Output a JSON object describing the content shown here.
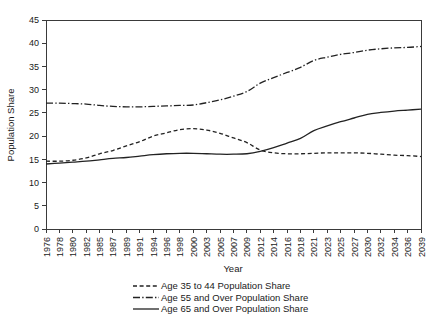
{
  "chart_data": {
    "type": "line",
    "title": "",
    "xlabel": "Year",
    "ylabel": "Population Share",
    "ylim": [
      0,
      45
    ],
    "ytick_step": 5,
    "yticks": [
      0,
      5,
      10,
      15,
      20,
      25,
      30,
      35,
      40,
      45
    ],
    "grid": false,
    "legend_position": "bottom",
    "categories": [
      "1976",
      "1978",
      "1980",
      "1982",
      "1985",
      "1987",
      "1989",
      "1991",
      "1994",
      "1996",
      "1998",
      "2000",
      "2003",
      "2005",
      "2007",
      "2009",
      "2012",
      "2014",
      "2016",
      "2018",
      "2021",
      "2023",
      "2025",
      "2027",
      "2030",
      "2032",
      "2034",
      "2036",
      "2039"
    ],
    "series": [
      {
        "name": "Age 35 to 44 Population Share",
        "style": "dashed",
        "values": [
          14.6,
          14.6,
          14.8,
          15.3,
          16.2,
          16.9,
          17.9,
          18.8,
          20.0,
          20.7,
          21.4,
          21.6,
          21.3,
          20.6,
          19.6,
          18.6,
          17.0,
          16.4,
          16.2,
          16.2,
          16.3,
          16.4,
          16.4,
          16.4,
          16.3,
          16.1,
          15.9,
          15.8,
          15.6
        ]
      },
      {
        "name": "Age 55 and Over Population Share",
        "style": "dash-dot",
        "values": [
          27.1,
          27.1,
          27.0,
          26.9,
          26.6,
          26.4,
          26.3,
          26.3,
          26.4,
          26.5,
          26.6,
          26.7,
          27.2,
          27.8,
          28.6,
          29.6,
          31.4,
          32.6,
          33.7,
          34.8,
          36.3,
          37.0,
          37.6,
          38.0,
          38.5,
          38.8,
          39.0,
          39.1,
          39.3
        ]
      },
      {
        "name": "Age 65 and Over Population Share",
        "style": "solid",
        "values": [
          14.0,
          14.2,
          14.4,
          14.6,
          14.9,
          15.2,
          15.4,
          15.7,
          16.0,
          16.2,
          16.3,
          16.3,
          16.2,
          16.1,
          16.1,
          16.2,
          16.7,
          17.5,
          18.5,
          19.5,
          21.2,
          22.2,
          23.1,
          23.9,
          24.7,
          25.1,
          25.4,
          25.6,
          25.8
        ]
      }
    ]
  },
  "legend": {
    "items": [
      {
        "label": "Age 35 to 44 Population Share",
        "style": "dashed"
      },
      {
        "label": "Age 55 and Over Population Share",
        "style": "dash-dot"
      },
      {
        "label": "Age 65 and Over Population Share",
        "style": "solid"
      }
    ]
  }
}
